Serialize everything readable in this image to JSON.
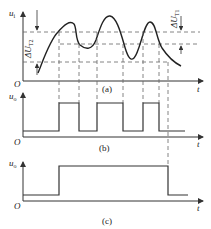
{
  "figure": {
    "panels": [
      {
        "id": "a",
        "caption": "(a)",
        "y_label": "u",
        "y_label_sub": "i",
        "x_label": "t",
        "origin_label": "O",
        "annotations": [
          {
            "label": "ΔU",
            "sub": "T2",
            "meaning": "hysteresis width between lower and upper thresholds"
          },
          {
            "label": "ΔU",
            "sub": "T1",
            "meaning": "narrower hysteresis band"
          }
        ]
      },
      {
        "id": "b",
        "caption": "(b)",
        "y_label": "u",
        "y_label_sub": "o",
        "x_label": "t",
        "origin_label": "O",
        "pulses": 3
      },
      {
        "id": "c",
        "caption": "(c)",
        "y_label": "u",
        "y_label_sub": "o",
        "x_label": "t",
        "origin_label": "O",
        "pulses": 1
      }
    ],
    "colors": {
      "line": "#333333",
      "dash": "#666666",
      "background": "#ffffff"
    }
  }
}
